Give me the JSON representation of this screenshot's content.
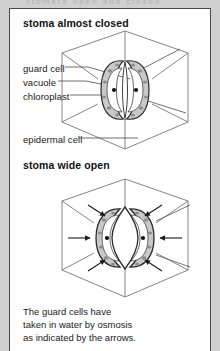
{
  "figure": {
    "clipped_header_text": "stomata open and closed",
    "panels": [
      {
        "title": "stoma almost closed",
        "state": "closed",
        "labels": [
          {
            "name": "guard-cell",
            "text": "guard cell"
          },
          {
            "name": "vacuole",
            "text": "vacuole"
          },
          {
            "name": "chloroplast",
            "text": "chloroplast"
          },
          {
            "name": "epidermal-cell",
            "text": "epidermal cell"
          }
        ]
      },
      {
        "title": "stoma wide open",
        "state": "open",
        "labels": []
      }
    ],
    "caption": {
      "line1": "The guard cells have",
      "line2": "taken in water by osmosis",
      "line3": "as indicated by the arrows."
    }
  },
  "colors": {
    "page_background": "#d0d0d0",
    "card_background": "#ffffff",
    "frame_border": "#4a4a4a",
    "guard_cell_fill": "#c9c9c9",
    "guard_cell_stroke": "#2b2b2b",
    "vacuole_fill": "#ffffff",
    "chloroplast_fill": "#8e8e8e",
    "nucleus_dot": "#111111",
    "pore_fill": "#ffffff",
    "epidermal_line": "#555555",
    "leader_line": "#4d4d4d",
    "arrow": "#1a1a1a",
    "text": "#1a1a1a"
  },
  "geometry": {
    "image_width": 220,
    "image_height": 351,
    "frame": {
      "x": 9,
      "y": 8,
      "width": 202,
      "height": 343
    }
  }
}
